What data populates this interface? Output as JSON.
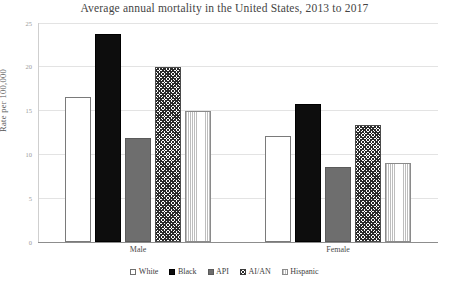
{
  "chart_data": {
    "type": "bar",
    "title": "Average annual mortality in the United States, 2013 to 2017",
    "xlabel": "",
    "ylabel": "Rate per 100,000",
    "categories": [
      "Male",
      "Female"
    ],
    "series": [
      {
        "name": "White",
        "values": [
          16.5,
          12.1
        ],
        "swatch": "open-square-white"
      },
      {
        "name": "Black",
        "values": [
          23.8,
          15.8
        ],
        "swatch": "filled-square-black"
      },
      {
        "name": "API",
        "values": [
          11.9,
          8.6
        ],
        "swatch": "filled-square-gray"
      },
      {
        "name": "AI/AN",
        "values": [
          20.0,
          13.4
        ],
        "swatch": "crosshatch-square"
      },
      {
        "name": "Hispanic",
        "values": [
          15.0,
          9.0
        ],
        "swatch": "vertical-lines-square"
      }
    ],
    "ylim": [
      0,
      25
    ],
    "yticks": [
      "0",
      "5",
      "10",
      "15",
      "20",
      "25"
    ],
    "grid": true,
    "legend_position": "bottom"
  },
  "colors": {
    "white_series": "#ffffff",
    "black_series": "#0d0d0d",
    "api_series": "#6e6e6e",
    "aian_series": "#2b2b2b",
    "hispanic_series": "#bdbdbd",
    "gridline": "#e3e3e3",
    "axis": "#8d8d8d",
    "text": "#3a3a3a",
    "background": "#ffffff"
  }
}
